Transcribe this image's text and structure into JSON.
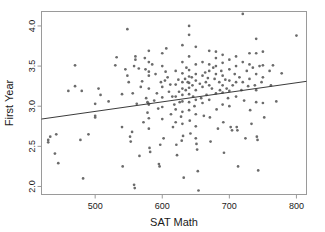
{
  "chart_data": {
    "type": "scatter",
    "title": "",
    "xlabel": "SAT Math",
    "ylabel": "First Year",
    "xlim": [
      420,
      815
    ],
    "ylim": [
      1.9,
      4.18
    ],
    "xticks": [
      500,
      600,
      700,
      800
    ],
    "yticks": [
      "2.0",
      "2.5",
      "3.0",
      "3.5",
      "4.0"
    ],
    "grid": false,
    "legend": null,
    "point_color": "#6b6b6b",
    "line_color": "#3b3b3b",
    "frame_color": "#9a9a9a",
    "trendline": {
      "type": "linear-fit",
      "x_start": 420,
      "y_start": 2.84,
      "x_end": 815,
      "y_end": 3.31
    },
    "series": [
      {
        "name": "students",
        "points": [
          [
            430,
            2.58
          ],
          [
            430,
            2.55
          ],
          [
            433,
            2.62
          ],
          [
            440,
            2.41
          ],
          [
            442,
            2.65
          ],
          [
            445,
            2.29
          ],
          [
            460,
            3.19
          ],
          [
            470,
            3.25
          ],
          [
            470,
            3.51
          ],
          [
            478,
            2.58
          ],
          [
            480,
            3.19
          ],
          [
            482,
            2.1
          ],
          [
            490,
            2.65
          ],
          [
            500,
            2.86
          ],
          [
            500,
            2.88
          ],
          [
            500,
            3.03
          ],
          [
            505,
            3.22
          ],
          [
            508,
            3.14
          ],
          [
            520,
            3.06
          ],
          [
            530,
            3.51
          ],
          [
            532,
            3.61
          ],
          [
            540,
            3.15
          ],
          [
            540,
            2.74
          ],
          [
            541,
            2.25
          ],
          [
            545,
            3.46
          ],
          [
            548,
            3.96
          ],
          [
            548,
            3.38
          ],
          [
            550,
            3.3
          ],
          [
            552,
            2.62
          ],
          [
            553,
            2.56
          ],
          [
            555,
            2.68
          ],
          [
            556,
            3.16
          ],
          [
            558,
            3.5
          ],
          [
            558,
            2.02
          ],
          [
            559,
            1.98
          ],
          [
            560,
            3.58
          ],
          [
            560,
            3.62
          ],
          [
            562,
            3.03
          ],
          [
            565,
            3.47
          ],
          [
            566,
            2.38
          ],
          [
            568,
            3.24
          ],
          [
            570,
            3.31
          ],
          [
            572,
            2.8
          ],
          [
            574,
            3.6
          ],
          [
            575,
            3.46
          ],
          [
            576,
            3.1
          ],
          [
            578,
            3.05
          ],
          [
            578,
            2.92
          ],
          [
            579,
            3.04
          ],
          [
            580,
            3.69
          ],
          [
            580,
            3.55
          ],
          [
            580,
            3.43
          ],
          [
            580,
            3.38
          ],
          [
            580,
            3.22
          ],
          [
            580,
            3.02
          ],
          [
            580,
            2.85
          ],
          [
            580,
            2.72
          ],
          [
            581,
            2.48
          ],
          [
            582,
            2.43
          ],
          [
            585,
            3.52
          ],
          [
            588,
            3.07
          ],
          [
            590,
            3.4
          ],
          [
            592,
            3.16
          ],
          [
            594,
            2.97
          ],
          [
            595,
            2.28
          ],
          [
            596,
            2.25
          ],
          [
            597,
            2.52
          ],
          [
            598,
            3.3
          ],
          [
            600,
            3.66
          ],
          [
            600,
            3.5
          ],
          [
            600,
            3.24
          ],
          [
            600,
            3.11
          ],
          [
            600,
            2.99
          ],
          [
            600,
            2.84
          ],
          [
            602,
            2.6
          ],
          [
            604,
            3.32
          ],
          [
            605,
            3.43
          ],
          [
            606,
            3.72
          ],
          [
            608,
            3.36
          ],
          [
            610,
            3.18
          ],
          [
            612,
            3.27
          ],
          [
            613,
            2.9
          ],
          [
            615,
            3.12
          ],
          [
            616,
            2.74
          ],
          [
            618,
            3.02
          ],
          [
            620,
            3.44
          ],
          [
            620,
            3.27
          ],
          [
            620,
            3.12
          ],
          [
            620,
            2.96
          ],
          [
            620,
            2.8
          ],
          [
            621,
            2.52
          ],
          [
            622,
            2.39
          ],
          [
            624,
            3.33
          ],
          [
            625,
            3.18
          ],
          [
            626,
            3.05
          ],
          [
            628,
            2.87
          ],
          [
            629,
            2.57
          ],
          [
            630,
            3.76
          ],
          [
            630,
            3.55
          ],
          [
            630,
            3.41
          ],
          [
            630,
            3.3
          ],
          [
            630,
            3.22
          ],
          [
            630,
            3.14
          ],
          [
            630,
            3.06
          ],
          [
            630,
            2.93
          ],
          [
            630,
            2.78
          ],
          [
            631,
            2.63
          ],
          [
            632,
            2.11
          ],
          [
            634,
            3.34
          ],
          [
            635,
            3.2
          ],
          [
            636,
            3.48
          ],
          [
            638,
            3.3
          ],
          [
            640,
            4.0
          ],
          [
            640,
            3.89
          ],
          [
            640,
            3.62
          ],
          [
            640,
            3.45
          ],
          [
            640,
            3.37
          ],
          [
            640,
            3.29
          ],
          [
            640,
            3.23
          ],
          [
            640,
            3.15
          ],
          [
            640,
            3.05
          ],
          [
            640,
            2.95
          ],
          [
            641,
            2.82
          ],
          [
            642,
            2.66
          ],
          [
            644,
            3.36
          ],
          [
            645,
            3.26
          ],
          [
            646,
            3.12
          ],
          [
            648,
            3.0
          ],
          [
            650,
            3.74
          ],
          [
            650,
            3.52
          ],
          [
            650,
            3.4
          ],
          [
            650,
            3.32
          ],
          [
            650,
            3.2
          ],
          [
            650,
            3.08
          ],
          [
            650,
            2.9
          ],
          [
            650,
            2.75
          ],
          [
            650,
            2.6
          ],
          [
            651,
            2.53
          ],
          [
            652,
            2.46
          ],
          [
            653,
            2.19
          ],
          [
            654,
            1.95
          ],
          [
            656,
            3.28
          ],
          [
            658,
            3.1
          ],
          [
            660,
            3.55
          ],
          [
            660,
            3.38
          ],
          [
            660,
            3.24
          ],
          [
            660,
            3.04
          ],
          [
            662,
            2.88
          ],
          [
            664,
            3.42
          ],
          [
            665,
            3.3
          ],
          [
            666,
            3.14
          ],
          [
            668,
            3.35
          ],
          [
            670,
            3.69
          ],
          [
            670,
            3.52
          ],
          [
            670,
            3.44
          ],
          [
            670,
            3.26
          ],
          [
            670,
            3.08
          ],
          [
            671,
            2.86
          ],
          [
            672,
            2.56
          ],
          [
            674,
            3.22
          ],
          [
            676,
            3.48
          ],
          [
            678,
            3.34
          ],
          [
            680,
            3.68
          ],
          [
            680,
            3.6
          ],
          [
            680,
            3.5
          ],
          [
            680,
            3.4
          ],
          [
            680,
            3.16
          ],
          [
            681,
            2.96
          ],
          [
            683,
            2.72
          ],
          [
            685,
            3.3
          ],
          [
            686,
            3.2
          ],
          [
            688,
            3.44
          ],
          [
            690,
            3.64
          ],
          [
            690,
            3.54
          ],
          [
            690,
            3.38
          ],
          [
            690,
            3.26
          ],
          [
            690,
            3.17
          ],
          [
            690,
            3.02
          ],
          [
            691,
            2.8
          ],
          [
            692,
            2.42
          ],
          [
            694,
            3.33
          ],
          [
            696,
            3.22
          ],
          [
            698,
            3.1
          ],
          [
            700,
            3.58
          ],
          [
            700,
            3.46
          ],
          [
            700,
            3.32
          ],
          [
            700,
            3.19
          ],
          [
            700,
            3.0
          ],
          [
            702,
            2.74
          ],
          [
            704,
            2.7
          ],
          [
            705,
            3.26
          ],
          [
            708,
            3.4
          ],
          [
            710,
            3.62
          ],
          [
            710,
            3.5
          ],
          [
            710,
            3.3
          ],
          [
            710,
            3.12
          ],
          [
            711,
            2.74
          ],
          [
            712,
            2.7
          ],
          [
            713,
            2.25
          ],
          [
            715,
            3.36
          ],
          [
            718,
            3.2
          ],
          [
            720,
            4.15
          ],
          [
            720,
            3.55
          ],
          [
            720,
            3.3
          ],
          [
            722,
            3.07
          ],
          [
            724,
            2.6
          ],
          [
            726,
            3.44
          ],
          [
            728,
            3.25
          ],
          [
            730,
            3.66
          ],
          [
            730,
            3.52
          ],
          [
            730,
            3.34
          ],
          [
            731,
            2.95
          ],
          [
            733,
            2.78
          ],
          [
            735,
            3.48
          ],
          [
            738,
            3.26
          ],
          [
            740,
            3.84
          ],
          [
            740,
            3.66
          ],
          [
            740,
            3.4
          ],
          [
            740,
            3.2
          ],
          [
            740,
            3.05
          ],
          [
            741,
            2.62
          ],
          [
            742,
            2.58
          ],
          [
            743,
            2.2
          ],
          [
            745,
            3.5
          ],
          [
            748,
            3.3
          ],
          [
            750,
            3.68
          ],
          [
            750,
            3.51
          ],
          [
            750,
            3.36
          ],
          [
            750,
            3.04
          ],
          [
            752,
            2.86
          ],
          [
            760,
            3.44
          ],
          [
            762,
            3.26
          ],
          [
            765,
            3.51
          ],
          [
            770,
            3.06
          ],
          [
            778,
            3.41
          ],
          [
            800,
            3.88
          ]
        ]
      }
    ]
  },
  "axes": {
    "x_label": "SAT Math",
    "y_label": "First Year",
    "x_tick_labels": [
      "500",
      "600",
      "700",
      "800"
    ],
    "y_tick_labels": [
      "2.0",
      "2.5",
      "3.0",
      "3.5",
      "4.0"
    ]
  }
}
